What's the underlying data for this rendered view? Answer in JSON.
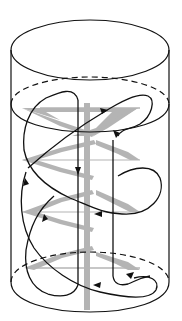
{
  "diagram": {
    "title": "Stirred tank with helical ribbon impeller and circulation flow",
    "colors": {
      "background": "#ffffff",
      "outline": "#111111",
      "impeller": "#b4b4b4",
      "flow": "#111111"
    },
    "elements": {
      "vessel": "cylindrical-vessel",
      "liquid_surface": "dashed-liquid-surface",
      "shaft": "impeller-shaft",
      "blades": "helical-ribbon-blades",
      "flow_paths": "circulation-flow-arrows"
    }
  }
}
